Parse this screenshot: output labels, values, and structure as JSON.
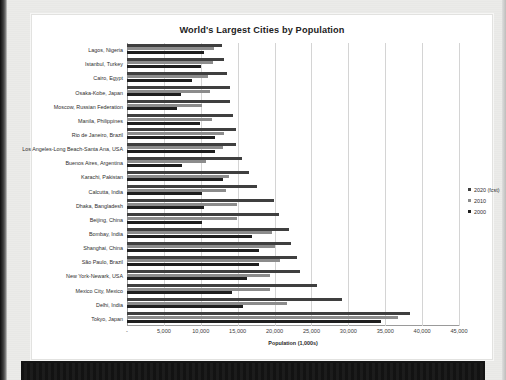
{
  "chart_data": {
    "type": "bar",
    "orientation": "horizontal",
    "title": "World's Largest Cities by Population",
    "xlabel": "Population (1,000s)",
    "ylabel": "",
    "xlim": [
      0,
      45000
    ],
    "xticks": [
      0,
      5000,
      10000,
      15000,
      20000,
      25000,
      30000,
      35000,
      40000,
      45000
    ],
    "xticklabels": [
      "-",
      "5,000",
      "10,000",
      "15,000",
      "20,000",
      "25,000",
      "30,000",
      "35,000",
      "40,000",
      "45,000"
    ],
    "grid": true,
    "legend_position": "right",
    "categories": [
      "Lagos, Nigeria",
      "Istanbul, Turkey",
      "Cairo, Egypt",
      "Osaka-Kobe, Japan",
      "Moscow, Russian Federation",
      "Manila, Philippines",
      "Rio de Janeiro, Brazil",
      "Los Angeles-Long Beach-Santa Ana, USA",
      "Buenos Aires, Argentina",
      "Karachi, Pakistan",
      "Calcutta, India",
      "Dhaka, Bangladesh",
      "Beijing, China",
      "Bombay, India",
      "Shanghai, China",
      "São Paulo, Brazil",
      "New York-Newark, USA",
      "Mexico City, Mexico",
      "Delhi, India",
      "Tokyo, Japan"
    ],
    "series": [
      {
        "name": "2020 (fcst)",
        "color": "#3f3f3f",
        "values": [
          12900,
          13100,
          13600,
          14000,
          14000,
          14400,
          14800,
          14800,
          15600,
          16500,
          17600,
          19900,
          20600,
          22000,
          22200,
          23000,
          23400,
          25800,
          29200,
          38400
        ]
      },
      {
        "name": "2010",
        "color": "#8c8c8c",
        "values": [
          11800,
          11700,
          11000,
          11300,
          10200,
          11500,
          13100,
          13000,
          10700,
          13800,
          13400,
          14900,
          14900,
          19600,
          20000,
          20700,
          19400,
          19400,
          21700,
          36700
        ]
      },
      {
        "name": "2000",
        "color": "#1f1f1f",
        "values": [
          10400,
          10000,
          8800,
          7300,
          6800,
          9900,
          11900,
          11900,
          7400,
          13000,
          10200,
          10400,
          10200,
          17000,
          17900,
          17900,
          16300,
          14200,
          15700,
          34400
        ]
      }
    ]
  },
  "legend": {
    "items": [
      {
        "label": "2020 (fcst)",
        "color": "#3f3f3f"
      },
      {
        "label": "2010",
        "color": "#8c8c8c"
      },
      {
        "label": "2000",
        "color": "#1f1f1f"
      }
    ]
  }
}
